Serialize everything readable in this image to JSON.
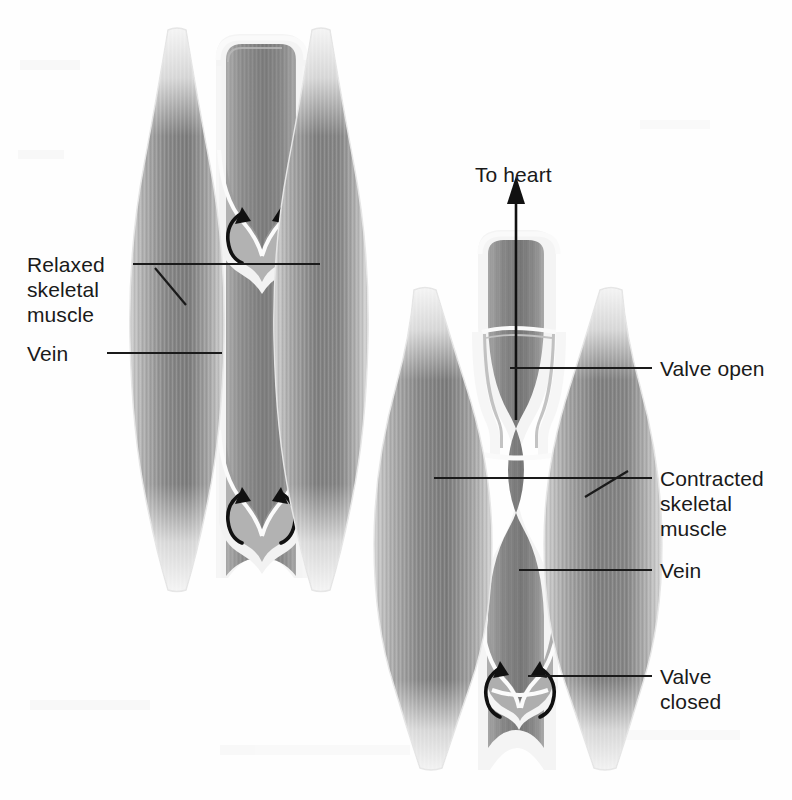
{
  "figure": {
    "background_color": "#fefefe",
    "ink_color": "#1a1a1a"
  },
  "labels": {
    "to_heart": "To heart",
    "relaxed_muscle": "Relaxed\nskeletal\nmuscle",
    "vein_left": "Vein",
    "valve_open": "Valve open",
    "contracted_muscle": "Contracted\nskeletal\nmuscle",
    "vein_right": "Vein",
    "valve_closed": "Valve\nclosed"
  },
  "panels": [
    {
      "name": "relaxed-panel",
      "state": "relaxed",
      "muscle_description": "Two slender relaxed skeletal muscle bellies flanking a straight open vein",
      "vein_state": "open, uncompressed",
      "valves": [
        {
          "name": "upper-valve",
          "state": "partially open",
          "flow_arrows": 2
        },
        {
          "name": "lower-valve",
          "state": "partially open",
          "flow_arrows": 2
        }
      ]
    },
    {
      "name": "contracted-panel",
      "state": "contracted",
      "muscle_description": "Two bulging contracted skeletal muscle bellies squeezing the vein",
      "vein_state": "compressed at mid-belly",
      "valves": [
        {
          "name": "open-valve",
          "state": "open",
          "flow_arrows": 0
        },
        {
          "name": "closed-valve",
          "state": "closed",
          "flow_arrows": 2
        }
      ],
      "flow_direction": "upward toward heart"
    }
  ],
  "colors": {
    "muscle_dark": "#6e6e6e",
    "muscle_mid": "#9a9a9a",
    "muscle_light": "#d8d8d8",
    "tendon": "#ededed",
    "vein_lumen": "#8c8c8c",
    "vein_wall": "#f2f2f2",
    "leader_line": "#1a1a1a"
  }
}
